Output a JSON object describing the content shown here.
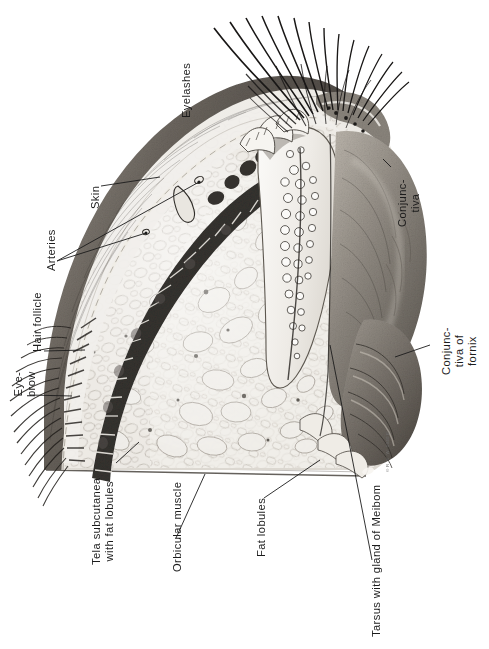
{
  "plate": {
    "title": "Sagittal section through the upper eyelid",
    "orientation": "rotated-90-ccw",
    "background_color": "#ffffff",
    "ink_color": "#1c1c1c",
    "signature": "© R. V. W. 1940 E."
  },
  "labels": [
    {
      "id": "eyelashes",
      "text": "Eyelashes",
      "lines": [
        "Eyelashes"
      ],
      "x": 180,
      "y": 118,
      "leader": false
    },
    {
      "id": "skin",
      "text": "Skin",
      "lines": [
        "Skin"
      ],
      "x": 89,
      "y": 209,
      "leader": true
    },
    {
      "id": "arteries",
      "text": "Arteries",
      "lines": [
        "Arteries"
      ],
      "x": 45,
      "y": 271,
      "leader": true
    },
    {
      "id": "hair-follicle",
      "text": "Hair follicle",
      "lines": [
        "Hair follicle"
      ],
      "x": 31,
      "y": 352,
      "leader": true
    },
    {
      "id": "eye-brow",
      "text": "Eye-brow",
      "lines": [
        "Eye-",
        "brow"
      ],
      "x": 12,
      "y": 397,
      "leader": true
    },
    {
      "id": "tela-subcutanea",
      "text": "Tela subcutanea with fat lobules",
      "lines": [
        "Tela subcutanea",
        "with fat lobules"
      ],
      "x": 90,
      "y": 565,
      "leader": true
    },
    {
      "id": "orbicular-muscle",
      "text": "Orbicular muscle",
      "lines": [
        "Orbicular muscle"
      ],
      "x": 171,
      "y": 572,
      "leader": true
    },
    {
      "id": "fat-lobules",
      "text": "Fat lobules",
      "lines": [
        "Fat lobules"
      ],
      "x": 255,
      "y": 557,
      "leader": true
    },
    {
      "id": "tarsus-meibom",
      "text": "Tarsus with gland of Meibom",
      "lines": [
        "Tarsus with gland of Meibom"
      ],
      "x": 370,
      "y": 637,
      "leader": true
    },
    {
      "id": "conjunctiva",
      "text": "Conjunctiva",
      "lines": [
        "Conjunc-",
        "tiva"
      ],
      "x": 396,
      "y": 227,
      "leader": true
    },
    {
      "id": "conjunctiva-of-fornix",
      "text": "Conjunctiva of fornix",
      "lines": [
        "Conjunc-",
        "tiva of",
        "fornix"
      ],
      "x": 440,
      "y": 375,
      "leader": true
    }
  ],
  "structures": [
    {
      "id": "eyelash-tuft",
      "name": "eyelashes"
    },
    {
      "id": "eyebrow-tuft",
      "name": "eyebrow hairs"
    },
    {
      "id": "skin-layer",
      "name": "skin"
    },
    {
      "id": "hair-follicle-row",
      "name": "hair follicles"
    },
    {
      "id": "orbicularis-band",
      "name": "orbicular muscle bundles"
    },
    {
      "id": "fat-lobule-field",
      "name": "fat lobules"
    },
    {
      "id": "tarsal-plate",
      "name": "tarsus with glands of Meibom"
    },
    {
      "id": "conjunctiva-sheet",
      "name": "conjunctiva"
    },
    {
      "id": "fornix-folds",
      "name": "conjunctiva of fornix"
    },
    {
      "id": "lid-margin",
      "name": "lid margin with gland orifices"
    },
    {
      "id": "artery-vessels",
      "name": "arteries"
    }
  ],
  "colors": {
    "paper": "#ffffff",
    "ink": "#1c1c1c",
    "skin_dark": "#55504c",
    "skin_mid": "#8b867f",
    "muscle_dark": "#3a3631",
    "fat_pale": "#e6e3dd",
    "conjunctiva_mid": "#9a948c",
    "tarsus_light": "#f2f0ec"
  }
}
